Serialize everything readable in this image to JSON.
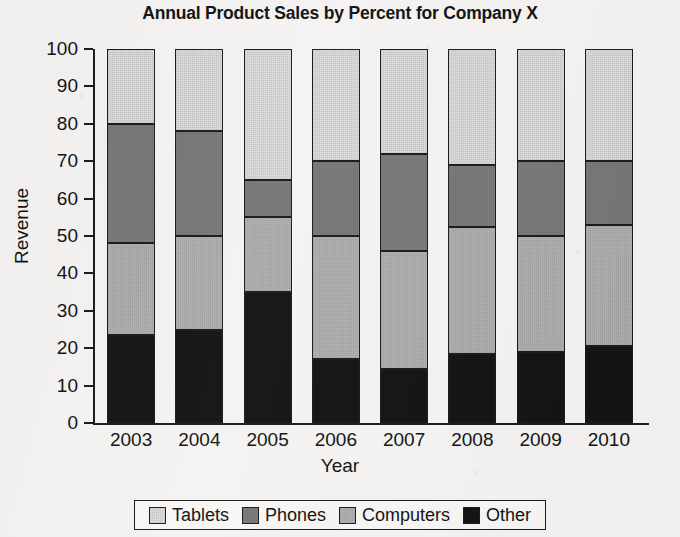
{
  "chart_data": {
    "type": "bar",
    "stacked": true,
    "title": "Annual Product Sales by Percent for Company X",
    "xlabel": "Year",
    "ylabel": "Revenue",
    "categories": [
      "2003",
      "2004",
      "2005",
      "2006",
      "2007",
      "2008",
      "2009",
      "2010"
    ],
    "ylim": [
      0,
      100
    ],
    "yticks": [
      0,
      10,
      20,
      30,
      40,
      50,
      60,
      70,
      80,
      90,
      100
    ],
    "ytick_labels": [
      "0",
      "10",
      "20",
      "30",
      "40",
      "50",
      "60",
      "70",
      "80",
      "90",
      "100"
    ],
    "grid": false,
    "legend_position": "bottom",
    "series": [
      {
        "name": "Other",
        "color": "#131313",
        "values": [
          23.5,
          25,
          35,
          17,
          14.5,
          18.5,
          19,
          20.5
        ]
      },
      {
        "name": "Computers",
        "color": "#b3b3b1",
        "values": [
          24.5,
          25,
          20,
          33,
          31.5,
          34,
          31,
          32.5
        ]
      },
      {
        "name": "Phones",
        "color": "#7d7d7d",
        "values": [
          32,
          28,
          10,
          20,
          26,
          16.5,
          20,
          17
        ]
      },
      {
        "name": "Tablets",
        "color": "#dfdedc",
        "values": [
          20,
          22,
          35,
          30,
          28,
          31,
          30,
          30
        ]
      }
    ],
    "cumulative_tops": {
      "other": [
        23.5,
        25,
        35,
        17,
        14.5,
        18.5,
        19,
        20.5
      ],
      "computers": [
        48,
        50,
        55,
        50,
        46,
        52.5,
        50,
        53
      ],
      "phones": [
        80,
        78,
        65,
        70,
        72,
        69,
        70,
        70
      ],
      "tablets": [
        100,
        100,
        100,
        100,
        100,
        100,
        100,
        100
      ]
    }
  },
  "legend": {
    "items": [
      {
        "label": "Tablets",
        "swatch_class": "seg-tablets"
      },
      {
        "label": "Phones",
        "swatch_class": "seg-phones"
      },
      {
        "label": "Computers",
        "swatch_class": "seg-computers"
      },
      {
        "label": "Other",
        "swatch_class": "seg-other"
      }
    ]
  }
}
